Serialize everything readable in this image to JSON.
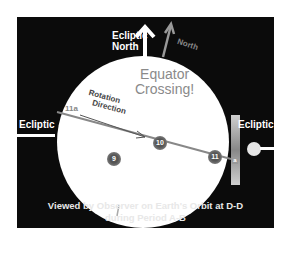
{
  "diagram": {
    "labels": {
      "ecliptic_north": [
        "Ecliptic",
        "North"
      ],
      "north": "North",
      "equator_crossing": [
        "Equator",
        "Crossing!"
      ],
      "rotation_direction": [
        "Rotation",
        "Direction"
      ],
      "ecliptic_left": "Ecliptic",
      "ecliptic_right": "Ecliptic",
      "point_11a": "11a",
      "marker_a": "a"
    },
    "markers": [
      "9",
      "10",
      "11"
    ],
    "caption": [
      "Viewed by Observer on Earth's Orbit at D-D",
      "during Period A-B"
    ],
    "colors": {
      "background": "#0b0b0b",
      "disc": "#ffffff",
      "axis": "#888888",
      "text": "#ffffff"
    }
  }
}
